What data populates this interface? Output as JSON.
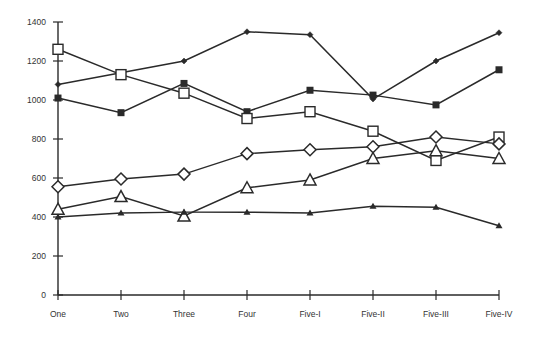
{
  "chart_data": {
    "type": "line",
    "title": "",
    "xlabel": "",
    "ylabel": "",
    "ylim": [
      0,
      1400
    ],
    "yticks": [
      0,
      200,
      400,
      600,
      800,
      1000,
      1200,
      1400
    ],
    "grid": false,
    "legend": "none",
    "categories": [
      "One",
      "Two",
      "Three",
      "Four",
      "Five-I",
      "Five-II",
      "Five-III",
      "Five-IV"
    ],
    "series": [
      {
        "name": "Series A (small filled diamond)",
        "marker": "small-diamond",
        "values": [
          1080,
          1140,
          1200,
          1350,
          1335,
          1005,
          1200,
          1345
        ]
      },
      {
        "name": "Series B (filled square)",
        "marker": "filled-square",
        "values": [
          1010,
          935,
          1085,
          940,
          1050,
          1025,
          975,
          1155
        ]
      },
      {
        "name": "Series C (open square)",
        "marker": "open-square",
        "values": [
          1260,
          1130,
          1035,
          905,
          940,
          840,
          690,
          810
        ]
      },
      {
        "name": "Series D (open diamond)",
        "marker": "open-diamond",
        "values": [
          555,
          595,
          620,
          725,
          745,
          760,
          810,
          775
        ]
      },
      {
        "name": "Series E (open triangle)",
        "marker": "open-triangle",
        "values": [
          440,
          505,
          405,
          550,
          590,
          700,
          740,
          700
        ]
      },
      {
        "name": "Series F (small filled triangle)",
        "marker": "small-triangle",
        "values": [
          400,
          420,
          425,
          425,
          420,
          455,
          450,
          355
        ]
      }
    ]
  },
  "colors": {
    "line": "#2a2a2a",
    "text": "#333333",
    "background": "#ffffff"
  }
}
